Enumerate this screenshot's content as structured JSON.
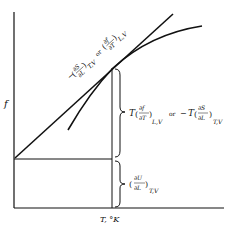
{
  "diagram": {
    "y_axis_label": "f",
    "x_axis_label": "T, °K",
    "tangent_label": {
      "part1_num": "∂S",
      "part1_den": "∂L",
      "part1_sub": "T,V",
      "or": "or",
      "part2_num": "∂f",
      "part2_den": "∂T",
      "part2_sub": "L,V",
      "minus": "−"
    },
    "upper_brace_label": {
      "T": "T",
      "num1": "∂f",
      "den1": "∂T",
      "sub1": "L,V",
      "or": "or",
      "minus": "−",
      "T2": "T",
      "num2": "∂S",
      "den2": "∂L",
      "sub2": "T,V"
    },
    "lower_brace_label": {
      "num": "∂U",
      "den": "∂L",
      "sub": "T,V"
    },
    "line_color": "#111111"
  }
}
